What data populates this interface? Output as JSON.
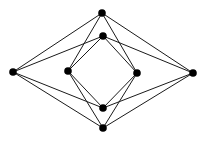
{
  "diagram": {
    "type": "graph",
    "colors": {
      "background": "#ffffff",
      "edge": "#1a1a1a",
      "node": "#000000"
    },
    "node_radius": 3.8,
    "nodes": [
      {
        "id": "top",
        "x": 102,
        "y": 13
      },
      {
        "id": "inner-top",
        "x": 103,
        "y": 36
      },
      {
        "id": "inner-bottom",
        "x": 103,
        "y": 108
      },
      {
        "id": "bottom",
        "x": 103,
        "y": 128
      },
      {
        "id": "left",
        "x": 13,
        "y": 72
      },
      {
        "id": "inner-left",
        "x": 68,
        "y": 71
      },
      {
        "id": "inner-right",
        "x": 137,
        "y": 73
      },
      {
        "id": "right",
        "x": 193,
        "y": 73
      }
    ],
    "edges": [
      [
        "top",
        "left"
      ],
      [
        "top",
        "inner-left"
      ],
      [
        "top",
        "inner-right"
      ],
      [
        "top",
        "right"
      ],
      [
        "inner-top",
        "left"
      ],
      [
        "inner-top",
        "inner-left"
      ],
      [
        "inner-top",
        "inner-right"
      ],
      [
        "inner-top",
        "right"
      ],
      [
        "inner-bottom",
        "left"
      ],
      [
        "inner-bottom",
        "inner-left"
      ],
      [
        "inner-bottom",
        "inner-right"
      ],
      [
        "inner-bottom",
        "right"
      ],
      [
        "bottom",
        "left"
      ],
      [
        "bottom",
        "inner-left"
      ],
      [
        "bottom",
        "inner-right"
      ],
      [
        "bottom",
        "right"
      ]
    ]
  }
}
